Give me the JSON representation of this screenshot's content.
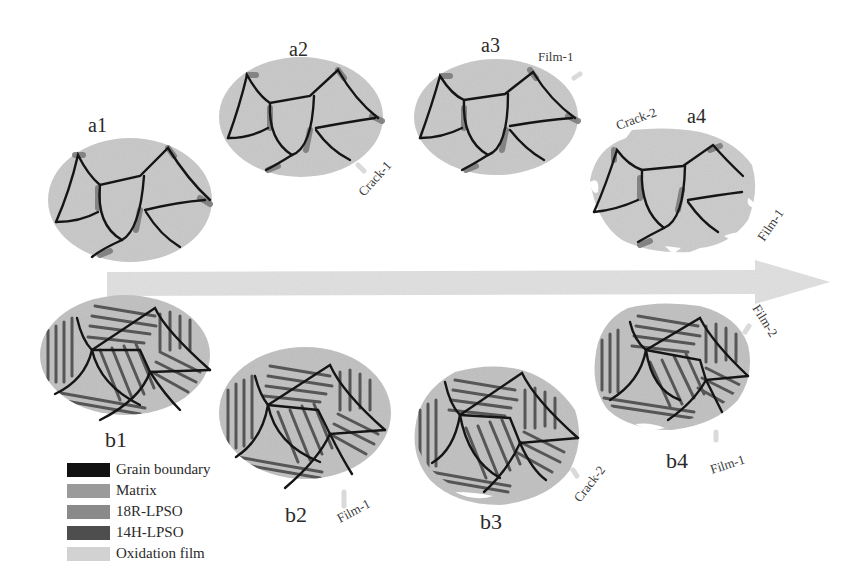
{
  "figure": {
    "panels": {
      "a1": {
        "label": "a1"
      },
      "a2": {
        "label": "a2"
      },
      "a3": {
        "label": "a3"
      },
      "a4": {
        "label": "a4"
      },
      "b1": {
        "label": "b1"
      },
      "b2": {
        "label": "b2"
      },
      "b3": {
        "label": "b3"
      },
      "b4": {
        "label": "b4"
      }
    },
    "annotations": {
      "a2_crack": "Crack-1",
      "a3_film": "Film-1",
      "a4_crack": "Crack-2",
      "a4_film": "Film-1",
      "b2_film": "Film-1",
      "b3_crack": "Crack-2",
      "b4_film2": "Film-2",
      "b4_film1": "Film-1"
    },
    "arrow": {
      "direction": "right",
      "meaning": "oxidation progression"
    },
    "legend": [
      {
        "label": "Grain boundary",
        "color": "#111111"
      },
      {
        "label": "Matrix",
        "color": "#9a9a9a"
      },
      {
        "label": "18R-LPSO",
        "color": "#8a8a8a"
      },
      {
        "label": "14H-LPSO",
        "color": "#4e4e4e"
      },
      {
        "label": "Oxidation film",
        "color": "#d2d2d2"
      }
    ],
    "colors": {
      "grain_fill": "#c9c9c9",
      "lpso_stripe": "#5a5a5a",
      "boundary": "#151515",
      "film": "#d9d9d9",
      "arrow": "#e1e1e1"
    }
  }
}
